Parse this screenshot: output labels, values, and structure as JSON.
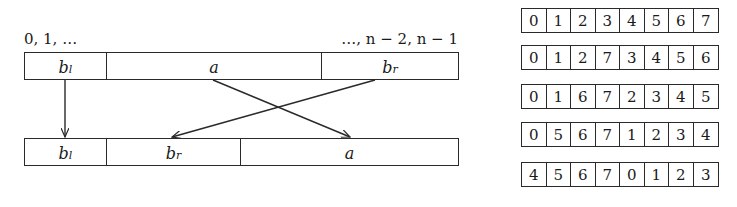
{
  "left_diagram": {
    "index_label_start": "0, 1, …",
    "index_label_end": "…, n − 2, n − 1",
    "top_bar": {
      "segments": [
        {
          "base": "b",
          "sub": "l",
          "x_start": 0,
          "x_end": 82
        },
        {
          "base": "a",
          "sub": "",
          "x_start": 82,
          "x_end": 297
        },
        {
          "base": "b",
          "sub": "r",
          "x_start": 297,
          "x_end": 435
        }
      ]
    },
    "bottom_bar": {
      "segments": [
        {
          "base": "b",
          "sub": "l",
          "x_start": 0,
          "x_end": 82
        },
        {
          "base": "b",
          "sub": "r",
          "x_start": 82,
          "x_end": 216
        },
        {
          "base": "a",
          "sub": "",
          "x_start": 216,
          "x_end": 435
        }
      ]
    },
    "arrows": [
      {
        "from": "b_l",
        "to": "b_l",
        "x1": 65,
        "y1": 80,
        "x2": 65,
        "y2": 137
      },
      {
        "from": "a",
        "to": "a",
        "x1": 213,
        "y1": 80,
        "x2": 350,
        "y2": 137
      },
      {
        "from": "b_r",
        "to": "b_r",
        "x1": 375,
        "y1": 80,
        "x2": 172,
        "y2": 137
      }
    ]
  },
  "arrays": [
    {
      "top": 8,
      "values": [
        "0",
        "1",
        "2",
        "3",
        "4",
        "5",
        "6",
        "7"
      ]
    },
    {
      "top": 45,
      "values": [
        "0",
        "1",
        "2",
        "7",
        "3",
        "4",
        "5",
        "6"
      ]
    },
    {
      "top": 84,
      "values": [
        "0",
        "1",
        "6",
        "7",
        "2",
        "3",
        "4",
        "5"
      ]
    },
    {
      "top": 122,
      "values": [
        "0",
        "5",
        "6",
        "7",
        "1",
        "2",
        "3",
        "4"
      ]
    },
    {
      "top": 162,
      "values": [
        "4",
        "5",
        "6",
        "7",
        "0",
        "1",
        "2",
        "3"
      ]
    }
  ],
  "colors": {
    "stroke": "#2a2a2a",
    "text": "#1a1a1a",
    "background": "#ffffff"
  }
}
